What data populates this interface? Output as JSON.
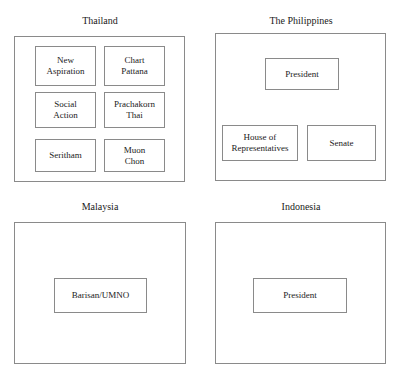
{
  "diagram": {
    "panels": [
      {
        "id": "thailand",
        "title": "Thailand",
        "nodes": [
          {
            "id": "new-aspiration",
            "label": "New\nAspiration"
          },
          {
            "id": "chart-pattana",
            "label": "Chart\nPattana"
          },
          {
            "id": "social-action",
            "label": "Social\nAction"
          },
          {
            "id": "prachakorn-thai",
            "label": "Prachakorn\nThai"
          },
          {
            "id": "seritham",
            "label": "Seritham"
          },
          {
            "id": "muon-chon",
            "label": "Muon\nChon"
          }
        ]
      },
      {
        "id": "philippines",
        "title": "The Philippines",
        "nodes": [
          {
            "id": "ph-president",
            "label": "President"
          },
          {
            "id": "ph-house",
            "label": "House of\nRepresentatives"
          },
          {
            "id": "ph-senate",
            "label": "Senate"
          }
        ]
      },
      {
        "id": "malaysia",
        "title": "Malaysia",
        "nodes": [
          {
            "id": "barisan-umno",
            "label": "Barisan/UMNO"
          }
        ]
      },
      {
        "id": "indonesia",
        "title": "Indonesia",
        "nodes": [
          {
            "id": "id-president",
            "label": "President"
          }
        ]
      }
    ],
    "colors": {
      "background": "#ffffff",
      "border": "#8a8a8a",
      "text": "#1a1a1a"
    }
  }
}
